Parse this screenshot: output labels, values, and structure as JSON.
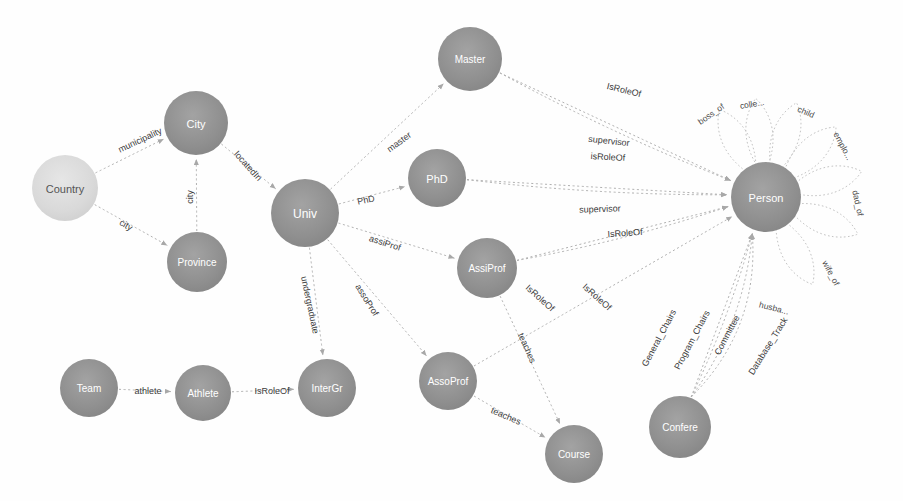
{
  "diagram": {
    "type": "node-link-graph",
    "canvas": {
      "width": 903,
      "height": 501,
      "background": "#fefefe"
    },
    "style": {
      "node_fill_dark": "#8c8c8c",
      "node_fill_light": "#d8d8d8",
      "node_label_light": "#ffffff",
      "node_label_dark": "#555555",
      "edge_color": "#b0b0b0",
      "edge_label_color": "#3b3b3b",
      "loop_color": "#c4c4c4"
    },
    "nodes": [
      {
        "id": "country",
        "label": "Country",
        "x": 65,
        "y": 188,
        "r": 33,
        "shade": "light",
        "label_size": 11
      },
      {
        "id": "city",
        "label": "City",
        "x": 196,
        "y": 123,
        "r": 32,
        "shade": "dark",
        "label_size": 11
      },
      {
        "id": "province",
        "label": "Province",
        "x": 197,
        "y": 262,
        "r": 30,
        "shade": "dark",
        "label_size": 10
      },
      {
        "id": "univ",
        "label": "Univ",
        "x": 305,
        "y": 213,
        "r": 34,
        "shade": "dark",
        "label_size": 12
      },
      {
        "id": "master",
        "label": "Master",
        "x": 470,
        "y": 59,
        "r": 32,
        "shade": "dark",
        "label_size": 10
      },
      {
        "id": "phd",
        "label": "PhD",
        "x": 437,
        "y": 178,
        "r": 29,
        "shade": "dark",
        "label_size": 11
      },
      {
        "id": "assiprof",
        "label": "AssiProf",
        "x": 487,
        "y": 268,
        "r": 30,
        "shade": "dark",
        "label_size": 10
      },
      {
        "id": "assoprof",
        "label": "AssoProf",
        "x": 448,
        "y": 381,
        "r": 29,
        "shade": "dark",
        "label_size": 10
      },
      {
        "id": "course",
        "label": "Course",
        "x": 574,
        "y": 454,
        "r": 29,
        "shade": "dark",
        "label_size": 10
      },
      {
        "id": "intergr",
        "label": "InterGr",
        "x": 327,
        "y": 388,
        "r": 29,
        "shade": "dark",
        "label_size": 10
      },
      {
        "id": "athlete",
        "label": "Athlete",
        "x": 203,
        "y": 393,
        "r": 28,
        "shade": "dark",
        "label_size": 10
      },
      {
        "id": "team",
        "label": "Team",
        "x": 89,
        "y": 388,
        "r": 29,
        "shade": "dark",
        "label_size": 10
      },
      {
        "id": "person",
        "label": "Person",
        "x": 766,
        "y": 197,
        "r": 35,
        "shade": "dark",
        "label_size": 11
      },
      {
        "id": "confere",
        "label": "Confere",
        "x": 680,
        "y": 427,
        "r": 31,
        "shade": "dark",
        "label_size": 10
      }
    ],
    "edges": [
      {
        "id": "e1",
        "source": "country",
        "target": "city",
        "label": "municipality",
        "lx": 140,
        "ly": 140,
        "angle": -25
      },
      {
        "id": "e2",
        "source": "country",
        "target": "province",
        "label": "city",
        "lx": 126,
        "ly": 225,
        "angle": 30
      },
      {
        "id": "e3",
        "source": "province",
        "target": "city",
        "label": "city",
        "lx": 190,
        "ly": 197,
        "angle": -90
      },
      {
        "id": "e4",
        "source": "city",
        "target": "univ",
        "label": "locatedIn",
        "lx": 248,
        "ly": 166,
        "angle": 48
      },
      {
        "id": "e5",
        "source": "univ",
        "target": "master",
        "label": "master",
        "lx": 399,
        "ly": 142,
        "angle": -36
      },
      {
        "id": "e6",
        "source": "univ",
        "target": "phd",
        "label": "PhD",
        "lx": 366,
        "ly": 200,
        "angle": -12
      },
      {
        "id": "e7",
        "source": "univ",
        "target": "assiprof",
        "label": "assiProf",
        "lx": 385,
        "ly": 243,
        "angle": 18
      },
      {
        "id": "e8",
        "source": "univ",
        "target": "intergr",
        "label": "undergraduate",
        "lx": 310,
        "ly": 305,
        "angle": 78
      },
      {
        "id": "e9",
        "source": "univ",
        "target": "assoprof",
        "label": "assoProf",
        "lx": 367,
        "ly": 300,
        "angle": 58
      },
      {
        "id": "e10",
        "source": "master",
        "target": "person",
        "label": "IsRoleOf",
        "lx": 624,
        "ly": 90,
        "angle": 14
      },
      {
        "id": "e11",
        "source": "master",
        "target": "person",
        "label": "supervisor",
        "lx": 609,
        "ly": 141,
        "angle": 6
      },
      {
        "id": "e12",
        "source": "phd",
        "target": "person",
        "label": "isRoleOf",
        "lx": 608,
        "ly": 157,
        "angle": 3
      },
      {
        "id": "e13",
        "source": "phd",
        "target": "person",
        "label": "supervisor",
        "lx": 600,
        "ly": 209,
        "angle": -2
      },
      {
        "id": "e14",
        "source": "assiprof",
        "target": "person",
        "label": "IsRoleOf",
        "lx": 625,
        "ly": 233,
        "angle": -4
      },
      {
        "id": "e15",
        "source": "assiprof",
        "target": "person",
        "label": "IsRoleOf",
        "lx": 540,
        "ly": 298,
        "angle": 42
      },
      {
        "id": "e16",
        "source": "assoprof",
        "target": "person",
        "label": "IsRoleOf",
        "lx": 597,
        "ly": 297,
        "angle": 42
      },
      {
        "id": "e17",
        "source": "assiprof",
        "target": "course",
        "label": "teaches",
        "lx": 527,
        "ly": 348,
        "angle": 66
      },
      {
        "id": "e18",
        "source": "assoprof",
        "target": "course",
        "label": "teaches",
        "lx": 506,
        "ly": 416,
        "angle": 23
      },
      {
        "id": "e19",
        "source": "team",
        "target": "athlete",
        "label": "athlete",
        "lx": 148,
        "ly": 391,
        "angle": 0
      },
      {
        "id": "e20",
        "source": "athlete",
        "target": "intergr",
        "label": "IsRoleOf",
        "lx": 272,
        "ly": 391,
        "angle": 0
      },
      {
        "id": "e21",
        "source": "confere",
        "target": "person",
        "label": "General_Chairs",
        "lx": 659,
        "ly": 338,
        "angle": -62
      },
      {
        "id": "e22",
        "source": "confere",
        "target": "person",
        "label": "Program_Chairs",
        "lx": 692,
        "ly": 340,
        "angle": -62
      },
      {
        "id": "e23",
        "source": "confere",
        "target": "person",
        "label": "Committee",
        "lx": 727,
        "ly": 335,
        "angle": -62
      },
      {
        "id": "e24",
        "source": "confere",
        "target": "person",
        "label": "Database_Track",
        "lx": 768,
        "ly": 346,
        "angle": -58
      }
    ],
    "self_loops": [
      {
        "id": "l1",
        "node": "person",
        "label": "boss_of",
        "angle": 118,
        "lx": 711,
        "ly": 114,
        "rot": -35
      },
      {
        "id": "l2",
        "node": "person",
        "label": "colle...",
        "angle": 96,
        "lx": 752,
        "ly": 104,
        "rot": -10
      },
      {
        "id": "l3",
        "node": "person",
        "label": "child",
        "angle": 72,
        "lx": 806,
        "ly": 112,
        "rot": 24
      },
      {
        "id": "l4",
        "node": "person",
        "label": "emplo...",
        "angle": 45,
        "lx": 843,
        "ly": 146,
        "rot": 62
      },
      {
        "id": "l5",
        "node": "person",
        "label": "dad_of",
        "angle": 15,
        "lx": 858,
        "ly": 203,
        "rot": 78
      },
      {
        "id": "l6",
        "node": "person",
        "label": "wife_of",
        "angle": -22,
        "lx": 831,
        "ly": 273,
        "rot": 62
      },
      {
        "id": "l7",
        "node": "person",
        "label": "husba...",
        "angle": -62,
        "lx": 774,
        "ly": 308,
        "rot": 14
      }
    ]
  }
}
